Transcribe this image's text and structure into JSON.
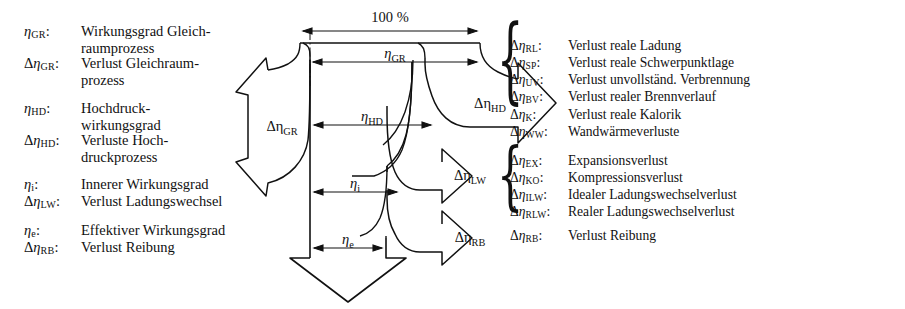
{
  "diagram": {
    "title_scale": "100 %",
    "center_labels": [
      {
        "id": "eta-gr",
        "text": "ηGR",
        "base": "η",
        "sub": "GR"
      },
      {
        "id": "eta-hd",
        "text": "ηHD",
        "base": "η",
        "sub": "HD"
      },
      {
        "id": "eta-i",
        "text": "ηi",
        "base": "η",
        "sub": "i"
      },
      {
        "id": "eta-e",
        "text": "ηe",
        "base": "η",
        "sub": "e"
      }
    ],
    "loss_arrows": [
      {
        "id": "d-eta-gr",
        "base": "Δη",
        "sub": "GR",
        "direction": "left"
      },
      {
        "id": "d-eta-hd",
        "base": "Δη",
        "sub": "HD",
        "direction": "right"
      },
      {
        "id": "d-eta-lw",
        "base": "Δη",
        "sub": "LW",
        "direction": "right"
      },
      {
        "id": "d-eta-rb",
        "base": "Δη",
        "sub": "RB",
        "direction": "right"
      }
    ],
    "output_arrow": {
      "id": "eta-e-output",
      "direction": "down"
    }
  },
  "legend_left": [
    {
      "rows": [
        {
          "key_base": "η",
          "key_sub": "GR",
          "key_delta": "",
          "colon": ":",
          "value": "Wirkungsgrad Gleich-",
          "value_cont": "raumprozess"
        },
        {
          "key_base": "η",
          "key_sub": "GR",
          "key_delta": "Δ",
          "colon": ":",
          "value": "Verlust Gleichraum-",
          "value_cont": "prozess"
        }
      ]
    },
    {
      "rows": [
        {
          "key_base": "η",
          "key_sub": "HD",
          "key_delta": "",
          "colon": ":",
          "value": "Hochdruck-",
          "value_cont": "wirkungsgrad"
        },
        {
          "key_base": "η",
          "key_sub": "HD",
          "key_delta": "Δ",
          "colon": ":",
          "value": "Verluste Hoch-",
          "value_cont": "druckprozess"
        }
      ]
    },
    {
      "rows": [
        {
          "key_base": "η",
          "key_sub": "i",
          "key_delta": "",
          "colon": ":",
          "value": "Innerer Wirkungsgrad",
          "value_cont": ""
        },
        {
          "key_base": "η",
          "key_sub": "LW",
          "key_delta": "Δ",
          "colon": ":",
          "value": "Verlust Ladungswechsel",
          "value_cont": ""
        }
      ]
    },
    {
      "rows": [
        {
          "key_base": "η",
          "key_sub": "e",
          "key_delta": "",
          "colon": ":",
          "value": "Effektiver Wirkungsgrad",
          "value_cont": ""
        },
        {
          "key_base": "η",
          "key_sub": "RB",
          "key_delta": "Δ",
          "colon": ":",
          "value": "Verlust Reibung",
          "value_cont": ""
        }
      ]
    }
  ],
  "legend_hd": {
    "rows": [
      {
        "key_delta": "Δ",
        "key_base": "η",
        "key_sub": "RL",
        "colon": ":",
        "value": "Verlust reale Ladung"
      },
      {
        "key_delta": "Δ",
        "key_base": "η",
        "key_sub": "SP",
        "colon": ":",
        "value": "Verlust reale Schwerpunktlage"
      },
      {
        "key_delta": "Δ",
        "key_base": "η",
        "key_sub": "UV",
        "colon": ":",
        "value": "Verlust unvollständ. Verbrennung"
      },
      {
        "key_delta": "Δ",
        "key_base": "η",
        "key_sub": "BV",
        "colon": ":",
        "value": "Verlust realer Brennverlauf"
      },
      {
        "key_delta": "Δ",
        "key_base": "η",
        "key_sub": "K",
        "colon": ":",
        "value": "Verlust reale Kalorik"
      },
      {
        "key_delta": "Δ",
        "key_base": "η",
        "key_sub": "WW",
        "colon": ":",
        "value": "Wandwärmeverluste"
      }
    ]
  },
  "legend_lw": {
    "rows": [
      {
        "key_delta": "Δ",
        "key_base": "η",
        "key_sub": "EX",
        "colon": ":",
        "value": "Expansionsverlust"
      },
      {
        "key_delta": "Δ",
        "key_base": "η",
        "key_sub": "KO",
        "colon": ":",
        "value": "Kompressionsverlust"
      },
      {
        "key_delta": "Δ",
        "key_base": "η",
        "key_sub": "ILW",
        "colon": ":",
        "value": "Idealer Ladungswechselverlust"
      },
      {
        "key_delta": "Δ",
        "key_base": "η",
        "key_sub": "RLW",
        "colon": ":",
        "value": "Realer Ladungswechselverlust"
      }
    ]
  },
  "legend_rb": {
    "rows": [
      {
        "key_delta": "Δ",
        "key_base": "η",
        "key_sub": "RB",
        "colon": ":",
        "value": "Verlust Reibung"
      }
    ]
  },
  "braces": {
    "hd": "{",
    "lw": "{"
  },
  "colors": {
    "ink": "#111111",
    "paper": "#ffffff"
  }
}
